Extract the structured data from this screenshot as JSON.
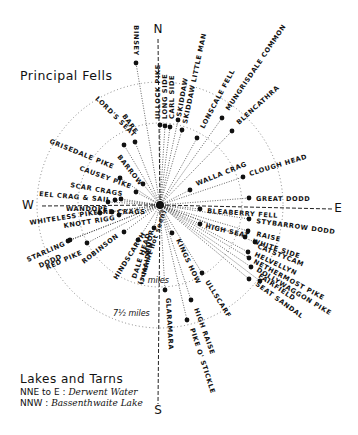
{
  "diagram": {
    "title": "Principal Fells",
    "center": {
      "x": 160,
      "y": 205
    },
    "compass": {
      "N": {
        "label": "N",
        "x": 158,
        "y": 33
      },
      "S": {
        "label": "S",
        "x": 158,
        "y": 414
      },
      "W": {
        "label": "W",
        "x": 28,
        "y": 209
      },
      "E": {
        "label": "E",
        "x": 338,
        "y": 212
      }
    },
    "rings": [
      {
        "label": "5 miles",
        "radius": 82,
        "label_x": 140,
        "label_y": 283
      },
      {
        "label": "7½ miles",
        "radius": 123,
        "label_x": 113,
        "label_y": 316
      }
    ],
    "fells": [
      {
        "name": "BINSEY",
        "x": 136,
        "y": 63
      },
      {
        "name": "ULLOCK PIKE",
        "x": 160,
        "y": 125
      },
      {
        "name": "LONG SIDE",
        "x": 165,
        "y": 126
      },
      {
        "name": "CARL SIDE",
        "x": 170,
        "y": 127
      },
      {
        "name": "SKIDDAW",
        "x": 178,
        "y": 120
      },
      {
        "name": "SKIDDAW LITTLE MAN",
        "x": 182,
        "y": 130
      },
      {
        "name": "LONSCALE FELL",
        "x": 197,
        "y": 138
      },
      {
        "name": "MUNGRISDALE COMMON",
        "x": 222,
        "y": 118
      },
      {
        "name": "BLENCATHRA",
        "x": 232,
        "y": 131
      },
      {
        "name": "CLOUGH HEAD",
        "x": 243,
        "y": 177
      },
      {
        "name": "WALLA CRAG",
        "x": 190,
        "y": 190
      },
      {
        "name": "GREAT DODD",
        "x": 249,
        "y": 198
      },
      {
        "name": "BLEABERRY FELL",
        "x": 200,
        "y": 209
      },
      {
        "name": "STYBARROW DODD",
        "x": 249,
        "y": 219
      },
      {
        "name": "HIGH SEAT",
        "x": 200,
        "y": 224
      },
      {
        "name": "RAISE",
        "x": 248,
        "y": 231
      },
      {
        "name": "WHITE SIDE",
        "x": 245,
        "y": 237
      },
      {
        "name": "CATSTYCAM",
        "x": 255,
        "y": 242
      },
      {
        "name": "HELVELLYN",
        "x": 248,
        "y": 252
      },
      {
        "name": "NETHERMOST PIKE",
        "x": 249,
        "y": 258
      },
      {
        "name": "DOLLYWAGGON PIKE",
        "x": 251,
        "y": 267
      },
      {
        "name": "FAIRFIELD",
        "x": 260,
        "y": 281
      },
      {
        "name": "SEAT SANDAL",
        "x": 249,
        "y": 279
      },
      {
        "name": "ULLSCARF",
        "x": 202,
        "y": 273
      },
      {
        "name": "KINGS HOW",
        "x": 172,
        "y": 233
      },
      {
        "name": "HIGH RAISE",
        "x": 191,
        "y": 300
      },
      {
        "name": "PIKE O' STICKLE",
        "x": 187,
        "y": 320
      },
      {
        "name": "GLARAMARA",
        "x": 165,
        "y": 290
      },
      {
        "name": "MAIDEN MOOR",
        "x": 154,
        "y": 228
      },
      {
        "name": "DALE HEAD",
        "x": 138,
        "y": 240
      },
      {
        "name": "HINDSCARTH",
        "x": 124,
        "y": 232
      },
      {
        "name": "ROBINSON",
        "x": 87,
        "y": 243
      },
      {
        "name": "RED PIKE",
        "x": 70,
        "y": 240
      },
      {
        "name": "STARLING DODD",
        "x": 68,
        "y": 241
      },
      {
        "name": "WHITELESS PIKE",
        "x": 100,
        "y": 213
      },
      {
        "name": "KNOTT RIGG",
        "x": 119,
        "y": 215
      },
      {
        "name": "WANDOPE",
        "x": 108,
        "y": 202
      },
      {
        "name": "ARD CRAGS",
        "x": 112,
        "y": 212
      },
      {
        "name": "EEL CRAG & SAIL",
        "x": 115,
        "y": 200
      },
      {
        "name": "SCAR CRAGS",
        "x": 121,
        "y": 199
      },
      {
        "name": "CAUSEY PIKE",
        "x": 136,
        "y": 192
      },
      {
        "name": "GRISEDALE PIKE",
        "x": 120,
        "y": 178
      },
      {
        "name": "BARROW",
        "x": 143,
        "y": 184
      },
      {
        "name": "LORD'S SEAT",
        "x": 124,
        "y": 145
      },
      {
        "name": "BARF",
        "x": 135,
        "y": 142
      }
    ],
    "labels": [
      {
        "text": "BINSEY",
        "x": 134,
        "y": 56,
        "rotate": 90,
        "anchor": "end"
      },
      {
        "text": "ULLOCK PIKE",
        "x": 160,
        "y": 119,
        "rotate": -90,
        "anchor": "start"
      },
      {
        "text": "LONG SIDE",
        "x": 167,
        "y": 119,
        "rotate": -90,
        "anchor": "start"
      },
      {
        "text": "CARL SIDE",
        "x": 174,
        "y": 119,
        "rotate": -90,
        "anchor": "start"
      },
      {
        "text": "SKIDDAW",
        "x": 181,
        "y": 117,
        "rotate": -80,
        "anchor": "start"
      },
      {
        "text": "SKIDDAW LITTLE MAN",
        "x": 187,
        "y": 124,
        "rotate": -78,
        "anchor": "start"
      },
      {
        "text": "LONSCALE FELL",
        "x": 204,
        "y": 129,
        "rotate": -62,
        "anchor": "start"
      },
      {
        "text": "MUNGRISDALE COMMON",
        "x": 229,
        "y": 111,
        "rotate": -56,
        "anchor": "start"
      },
      {
        "text": "BLENCATHRA",
        "x": 239,
        "y": 125,
        "rotate": -42,
        "anchor": "start"
      },
      {
        "text": "CLOUGH HEAD",
        "x": 250,
        "y": 176,
        "rotate": -17,
        "anchor": "start"
      },
      {
        "text": "WALLA CRAG",
        "x": 197,
        "y": 186,
        "rotate": -22,
        "anchor": "start"
      },
      {
        "text": "GREAT DODD",
        "x": 256,
        "y": 201,
        "rotate": 0,
        "anchor": "start"
      },
      {
        "text": "BLEABERRY FELL",
        "x": 207,
        "y": 213,
        "rotate": 4,
        "anchor": "start"
      },
      {
        "text": "STYBARROW DODD",
        "x": 256,
        "y": 223,
        "rotate": 8,
        "anchor": "start"
      },
      {
        "text": "HIGH SEAT",
        "x": 205,
        "y": 228,
        "rotate": 13,
        "anchor": "start"
      },
      {
        "text": "RAISE",
        "x": 256,
        "y": 236,
        "rotate": 13,
        "anchor": "start"
      },
      {
        "text": "WHITE SIDE",
        "x": 252,
        "y": 243,
        "rotate": 18,
        "anchor": "start"
      },
      {
        "text": "CATSTYCAM",
        "x": 257,
        "y": 248,
        "rotate": 22,
        "anchor": "start"
      },
      {
        "text": "HELVELLYN",
        "x": 254,
        "y": 256,
        "rotate": 25,
        "anchor": "start"
      },
      {
        "text": "NETHERMOST PIKE",
        "x": 253,
        "y": 263,
        "rotate": 28,
        "anchor": "start"
      },
      {
        "text": "DOLLYWAGGON PIKE",
        "x": 256,
        "y": 271,
        "rotate": 31,
        "anchor": "start"
      },
      {
        "text": "FAIRFIELD",
        "x": 258,
        "y": 277,
        "rotate": 34,
        "anchor": "start"
      },
      {
        "text": "SEAT SANDAL",
        "x": 255,
        "y": 285,
        "rotate": 36,
        "anchor": "start"
      },
      {
        "text": "ULLSCARF",
        "x": 205,
        "y": 282,
        "rotate": 58,
        "anchor": "start"
      },
      {
        "text": "KINGS HOW",
        "x": 176,
        "y": 240,
        "rotate": 65,
        "anchor": "start"
      },
      {
        "text": "HIGH RAISE",
        "x": 194,
        "y": 309,
        "rotate": 70,
        "anchor": "start"
      },
      {
        "text": "PIKE O' STICKLE",
        "x": 190,
        "y": 329,
        "rotate": 72,
        "anchor": "start"
      },
      {
        "text": "GLARAMARA",
        "x": 166,
        "y": 298,
        "rotate": 87,
        "anchor": "start"
      },
      {
        "text": "MOOR",
        "x": 154,
        "y": 230,
        "rotate": -78,
        "anchor": "end"
      },
      {
        "text": "MAIDEN",
        "x": 146,
        "y": 275,
        "rotate": -78,
        "anchor": "start"
      },
      {
        "text": "DALE HEAD",
        "x": 136,
        "y": 279,
        "rotate": -72,
        "anchor": "start"
      },
      {
        "text": "(summit not seen)",
        "x": 142,
        "y": 285,
        "rotate": -72,
        "anchor": "start"
      },
      {
        "text": "HINDSCARTH",
        "x": 117,
        "y": 280,
        "rotate": -58,
        "anchor": "start"
      },
      {
        "text": "ROBINSON",
        "x": 84,
        "y": 264,
        "rotate": -38,
        "anchor": "start"
      },
      {
        "text": "RED PIKE",
        "x": 47,
        "y": 270,
        "rotate": -24,
        "anchor": "start"
      },
      {
        "text": "STARLING",
        "x": 28,
        "y": 262,
        "rotate": -24,
        "anchor": "start"
      },
      {
        "text": "DODD",
        "x": 40,
        "y": 268,
        "rotate": -24,
        "anchor": "start"
      },
      {
        "text": "WHITELESS PIKE",
        "x": 30,
        "y": 225,
        "rotate": -9,
        "anchor": "start"
      },
      {
        "text": "KNOTT RIGG",
        "x": 64,
        "y": 228,
        "rotate": -9,
        "anchor": "start"
      },
      {
        "text": "WANDOPE",
        "x": 66,
        "y": 211,
        "rotate": 0,
        "anchor": "start"
      },
      {
        "text": "ARD CRAGS",
        "x": 97,
        "y": 214,
        "rotate": 0,
        "anchor": "start"
      },
      {
        "text": "EEL CRAG & SAIL",
        "x": 39,
        "y": 196,
        "rotate": 5,
        "anchor": "start"
      },
      {
        "text": "SCAR CRAGS",
        "x": 70,
        "y": 187,
        "rotate": 10,
        "anchor": "start"
      },
      {
        "text": "CAUSEY PIKE",
        "x": 79,
        "y": 170,
        "rotate": 20,
        "anchor": "start"
      },
      {
        "text": "GRISEDALE PIKE",
        "x": 49,
        "y": 143,
        "rotate": 22,
        "anchor": "start"
      },
      {
        "text": "BARROW",
        "x": 117,
        "y": 157,
        "rotate": 52,
        "anchor": "start"
      },
      {
        "text": "LORD'S SEAT",
        "x": 95,
        "y": 99,
        "rotate": 45,
        "anchor": "start"
      },
      {
        "text": "BARF",
        "x": 122,
        "y": 116,
        "rotate": 55,
        "anchor": "start"
      }
    ]
  },
  "lakes": {
    "title": "Lakes and Tarns",
    "rows": [
      {
        "bearing": "NNE to E :",
        "name": "Derwent Water"
      },
      {
        "bearing": "NNW :",
        "name": "Bassenthwaite Lake"
      }
    ]
  }
}
